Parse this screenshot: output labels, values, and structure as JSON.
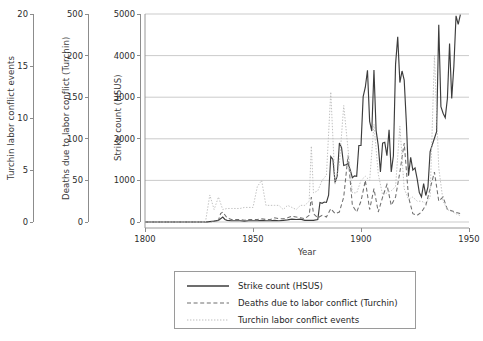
{
  "chart_data": {
    "type": "line",
    "title": "",
    "xlabel": "Year",
    "xlim": [
      1800,
      1950
    ],
    "xticks": [
      1800,
      1850,
      1900,
      1950
    ],
    "grid": "horizontal",
    "legend_position": "bottom",
    "axes": [
      {
        "id": "axis-turchin-events",
        "ylabel": "Turchin labor conflict events",
        "yticks": [
          0,
          5,
          10,
          15,
          20
        ],
        "ylim": [
          0,
          20
        ],
        "position": "outer-left"
      },
      {
        "id": "axis-turchin-deaths",
        "ylabel": "Deaths due to labor conflict (Turchin)",
        "yticks": [
          0,
          50,
          100,
          150,
          200,
          500
        ],
        "ylim": [
          0,
          500
        ],
        "position": "middle-left"
      },
      {
        "id": "axis-strike-count",
        "ylabel": "Strike count (HSUS)",
        "yticks": [
          0,
          1000,
          2000,
          3000,
          4000,
          5000
        ],
        "ylim": [
          0,
          5000
        ],
        "position": "inner-left"
      }
    ],
    "series": [
      {
        "name": "Strike count (HSUS)",
        "key": "strike_count",
        "axis": "axis-strike-count",
        "style": "solid",
        "color": "#3c3c3c",
        "x": [
          1800,
          1825,
          1828,
          1830,
          1832,
          1834,
          1836,
          1837,
          1838,
          1840,
          1842,
          1844,
          1846,
          1848,
          1850,
          1852,
          1854,
          1856,
          1858,
          1860,
          1862,
          1864,
          1866,
          1868,
          1870,
          1872,
          1874,
          1876,
          1878,
          1880,
          1881,
          1882,
          1883,
          1884,
          1885,
          1886,
          1887,
          1888,
          1889,
          1890,
          1891,
          1892,
          1893,
          1894,
          1895,
          1896,
          1897,
          1898,
          1899,
          1900,
          1901,
          1902,
          1903,
          1904,
          1905,
          1906,
          1907,
          1908,
          1909,
          1910,
          1911,
          1912,
          1913,
          1914,
          1915,
          1916,
          1917,
          1918,
          1919,
          1920,
          1921,
          1922,
          1923,
          1924,
          1925,
          1926,
          1927,
          1928,
          1929,
          1930,
          1931,
          1932,
          1933,
          1934,
          1935,
          1936,
          1937,
          1938,
          1939,
          1940,
          1941,
          1942,
          1943,
          1944,
          1945,
          1946
        ],
        "y": [
          0,
          0,
          0,
          10,
          20,
          40,
          120,
          60,
          40,
          30,
          30,
          30,
          20,
          30,
          30,
          30,
          40,
          30,
          30,
          40,
          30,
          40,
          50,
          70,
          60,
          70,
          40,
          40,
          40,
          60,
          470,
          450,
          480,
          470,
          645,
          1572,
          1503,
          946,
          1111,
          1897,
          1786,
          1359,
          1375,
          1404,
          1255,
          1066,
          1110,
          1098,
          1838,
          1839,
          3012,
          3240,
          3648,
          2419,
          2186,
          3655,
          2197,
          1835,
          1204,
          1897,
          1915,
          1594,
          2214,
          1204,
          1593,
          3789,
          4450,
          3353,
          3630,
          3411,
          2385,
          1112,
          1553,
          1249,
          1301,
          1035,
          707,
          604,
          921,
          637,
          841,
          1695,
          1856,
          2014,
          2172,
          4740,
          2772,
          2613,
          2508,
          2968,
          4288,
          2968,
          3752,
          4956,
          4750,
          4985
        ]
      },
      {
        "name": "Deaths due to labor conflict (Turchin)",
        "key": "deaths_labor_conflict",
        "axis": "axis-turchin-deaths",
        "style": "dashed",
        "color": "#6f6f6f",
        "x": [
          1800,
          1825,
          1830,
          1834,
          1835,
          1836,
          1838,
          1840,
          1842,
          1844,
          1846,
          1848,
          1850,
          1852,
          1854,
          1856,
          1858,
          1860,
          1862,
          1864,
          1866,
          1868,
          1870,
          1872,
          1874,
          1876,
          1877,
          1878,
          1880,
          1882,
          1884,
          1886,
          1888,
          1890,
          1892,
          1894,
          1896,
          1898,
          1900,
          1902,
          1904,
          1906,
          1908,
          1910,
          1912,
          1914,
          1916,
          1918,
          1920,
          1922,
          1924,
          1926,
          1928,
          1930,
          1932,
          1934,
          1936,
          1938,
          1940,
          1946
        ],
        "y": [
          0,
          0,
          0,
          2,
          10,
          12,
          5,
          3,
          3,
          3,
          2,
          3,
          3,
          3,
          4,
          3,
          3,
          5,
          4,
          4,
          5,
          7,
          6,
          5,
          4,
          8,
          30,
          10,
          5,
          8,
          6,
          16,
          10,
          12,
          30,
          80,
          20,
          12,
          25,
          50,
          15,
          40,
          12,
          30,
          45,
          20,
          30,
          60,
          95,
          30,
          10,
          8,
          12,
          20,
          40,
          60,
          25,
          30,
          15,
          10
        ]
      },
      {
        "name": "Turchin labor conflict events",
        "key": "turchin_events",
        "axis": "axis-turchin-events",
        "style": "dotted",
        "color": "#bdbdbd",
        "x": [
          1800,
          1825,
          1828,
          1830,
          1832,
          1834,
          1836,
          1838,
          1840,
          1842,
          1844,
          1846,
          1848,
          1850,
          1852,
          1854,
          1856,
          1858,
          1860,
          1862,
          1864,
          1866,
          1868,
          1870,
          1872,
          1874,
          1876,
          1877,
          1878,
          1880,
          1882,
          1884,
          1886,
          1888,
          1890,
          1892,
          1894,
          1896,
          1898,
          1900,
          1902,
          1904,
          1906,
          1908,
          1910,
          1912,
          1914,
          1916,
          1918,
          1920,
          1922,
          1924,
          1926,
          1928,
          1930,
          1932,
          1934,
          1936,
          1938,
          1940,
          1946
        ],
        "y": [
          0,
          0,
          0,
          2.6,
          1.2,
          2.4,
          1.2,
          1.3,
          1.3,
          1.3,
          1.3,
          1.4,
          1.4,
          1.4,
          3.4,
          4.0,
          1.6,
          1.6,
          1.6,
          1.6,
          1.2,
          1.6,
          1.4,
          1.2,
          1.6,
          1.6,
          2.0,
          7.3,
          2.8,
          3.0,
          4.0,
          4.5,
          12.5,
          3.6,
          5.6,
          11.2,
          7.0,
          2.8,
          2.8,
          4.0,
          4.4,
          4.0,
          9.4,
          4.6,
          2.6,
          2.8,
          3.0,
          3.4,
          9.2,
          3.2,
          2.2,
          2.4,
          2.0,
          2.0,
          1.8,
          2.4,
          16.0,
          5.2,
          2.0,
          1.2,
          0.6
        ]
      }
    ],
    "legend": [
      {
        "label": "Strike count (HSUS)",
        "style": "solid",
        "color": "#3c3c3c"
      },
      {
        "label": "Deaths due to labor conflict (Turchin)",
        "style": "dashed",
        "color": "#6f6f6f"
      },
      {
        "label": "Turchin labor conflict events",
        "style": "dotted",
        "color": "#bdbdbd"
      }
    ]
  }
}
